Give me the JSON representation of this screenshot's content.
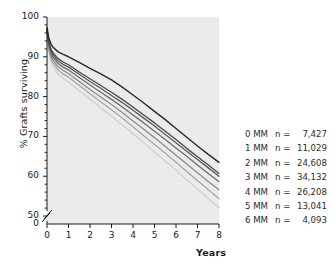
{
  "chart_data": {
    "type": "line",
    "title": "",
    "xlabel": "Years",
    "ylabel": "% Grafts surviving",
    "xlim": [
      0,
      8
    ],
    "ylim": [
      48,
      100
    ],
    "xticks": [
      "0",
      "1",
      "2",
      "3",
      "4",
      "5",
      "6",
      "7",
      "8"
    ],
    "yticks": [
      "50",
      "60",
      "70",
      "80",
      "90",
      "100"
    ],
    "y_axis_break": true,
    "y_axis_break_label": "0",
    "grid": false,
    "legend_position": "right",
    "x": [
      0,
      0.08,
      0.17,
      0.25,
      0.5,
      0.75,
      1,
      1.5,
      2,
      2.5,
      3,
      3.5,
      4,
      4.5,
      5,
      5.5,
      6,
      6.5,
      7,
      7.5,
      8
    ],
    "series": [
      {
        "name": "0 MM",
        "n": "7,427",
        "color": "#2e2e2e",
        "width": 1.5,
        "values": [
          97.3,
          94.8,
          93.4,
          92.6,
          91.3,
          90.6,
          90.0,
          88.6,
          87.1,
          85.7,
          84.2,
          82.4,
          80.4,
          78.4,
          76.3,
          74.2,
          72.0,
          69.8,
          67.6,
          65.5,
          63.5
        ]
      },
      {
        "name": "1 MM",
        "n": "11,029",
        "color": "#4a4a4a",
        "width": 1.3,
        "values": [
          97.0,
          93.9,
          92.2,
          91.2,
          89.6,
          88.7,
          88.0,
          86.2,
          84.5,
          82.8,
          81.1,
          79.3,
          77.4,
          75.4,
          73.4,
          71.3,
          69.2,
          67.0,
          64.9,
          62.8,
          60.7
        ]
      },
      {
        "name": "2 MM",
        "n": "24,608",
        "color": "#5a5a5a",
        "width": 1.3,
        "values": [
          96.9,
          93.5,
          91.7,
          90.7,
          89.0,
          88.1,
          87.4,
          85.6,
          83.8,
          82.1,
          80.3,
          78.5,
          76.6,
          74.6,
          72.6,
          70.5,
          68.4,
          66.3,
          64.2,
          62.1,
          60.0
        ]
      },
      {
        "name": "3 MM",
        "n": "34,132",
        "color": "#6e6e6e",
        "width": 1.3,
        "values": [
          96.8,
          93.1,
          91.2,
          90.1,
          88.4,
          87.4,
          86.7,
          84.8,
          82.9,
          81.1,
          79.3,
          77.4,
          75.4,
          73.4,
          71.3,
          69.2,
          67.1,
          65.0,
          62.8,
          60.7,
          58.6
        ]
      },
      {
        "name": "4 MM",
        "n": "26,208",
        "color": "#8c8c8c",
        "width": 1.3,
        "values": [
          96.6,
          92.6,
          90.6,
          89.4,
          87.6,
          86.6,
          85.8,
          83.8,
          81.8,
          79.9,
          78.0,
          76.0,
          73.9,
          71.8,
          69.7,
          67.5,
          65.3,
          63.1,
          60.9,
          58.7,
          56.6
        ]
      },
      {
        "name": "5 MM",
        "n": "13,041",
        "color": "#a6a6a6",
        "width": 1.3,
        "values": [
          96.4,
          92.1,
          90.0,
          88.7,
          86.8,
          85.7,
          84.9,
          82.8,
          80.7,
          78.7,
          76.7,
          74.6,
          72.4,
          70.2,
          68.0,
          65.8,
          63.5,
          61.2,
          58.9,
          56.6,
          54.4
        ]
      },
      {
        "name": "6 MM",
        "n": "4,093",
        "color": "#d2d2d2",
        "width": 1.5,
        "values": [
          96.2,
          91.5,
          89.2,
          87.8,
          85.8,
          84.6,
          83.7,
          81.5,
          79.3,
          77.2,
          75.1,
          72.9,
          70.7,
          68.4,
          66.1,
          63.8,
          61.5,
          59.1,
          56.8,
          54.4,
          52.1
        ]
      }
    ]
  },
  "legend": {
    "n_symbol": "n =",
    "rows": [
      {
        "label": "0 MM",
        "n": "7,427"
      },
      {
        "label": "1 MM",
        "n": "11,029"
      },
      {
        "label": "2 MM",
        "n": "24,608"
      },
      {
        "label": "3 MM",
        "n": "34,132"
      },
      {
        "label": "4 MM",
        "n": "26,208"
      },
      {
        "label": "5 MM",
        "n": "13,041"
      },
      {
        "label": "6 MM",
        "n": "4,093"
      }
    ]
  },
  "colors": {
    "plot_background": "#ebebeb",
    "axis": "#1a1a1a",
    "text": "#1a1a1a"
  }
}
